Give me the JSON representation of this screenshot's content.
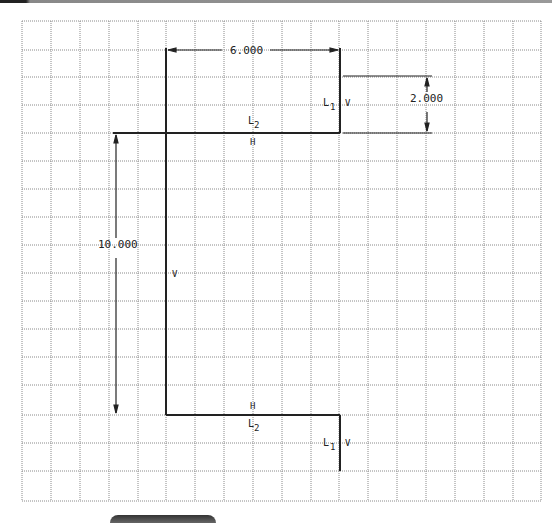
{
  "drawing": {
    "grid": {
      "x_lines": [
        22,
        51,
        80,
        109,
        138,
        166,
        195,
        224,
        253,
        282,
        311,
        339,
        368,
        397,
        426,
        455,
        484,
        513,
        541
      ],
      "y_lines": [
        21,
        50,
        77,
        105,
        133,
        161,
        189,
        217,
        245,
        273,
        301,
        329,
        357,
        385,
        415,
        443,
        471,
        501
      ],
      "color": "#8a8a8a"
    },
    "dimensions": {
      "top_width": "6.000",
      "right_height": "2.000",
      "left_height": "10.000"
    },
    "labels": {
      "top_L2": "L",
      "top_L2_sub": "2",
      "top_H": "H",
      "top_L1": "L",
      "top_L1_sub": "1",
      "top_V": "V",
      "mid_V": "V",
      "bottom_H": "H",
      "bottom_L2": "L",
      "bottom_L2_sub": "2",
      "bottom_L1": "L",
      "bottom_L1_sub": "1",
      "bottom_V": "V"
    },
    "line_color": "#222222"
  }
}
